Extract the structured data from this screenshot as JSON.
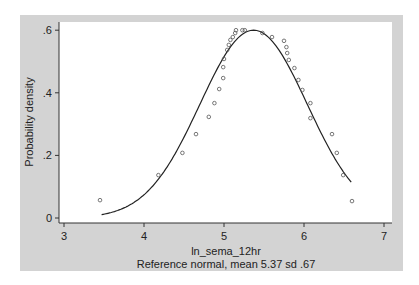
{
  "chart_data": {
    "type": "scatter",
    "title": "",
    "xlabel": "ln_sema_12hr",
    "ylabel": "Probability density",
    "note": "Reference normal, mean 5.37 sd .67",
    "xlim": [
      3,
      7
    ],
    "ylim": [
      0,
      0.6
    ],
    "x_ticks": [
      3,
      4,
      5,
      6,
      7
    ],
    "x_tick_labels": [
      "3",
      "4",
      "5",
      "6",
      "7"
    ],
    "y_ticks": [
      0,
      0.2,
      0.4,
      0.6
    ],
    "y_tick_labels": [
      "0",
      ".2",
      ".4",
      ".6"
    ],
    "grid": false,
    "legend": null,
    "series": [
      {
        "name": "Observed density",
        "style": "hollow-circle",
        "x": [
          3.45,
          4.18,
          4.48,
          4.65,
          4.81,
          4.88,
          4.94,
          4.99,
          4.99,
          5.0,
          5.04,
          5.06,
          5.08,
          5.11,
          5.14,
          5.15,
          5.23,
          5.26,
          5.48,
          5.6,
          5.75,
          5.78,
          5.79,
          5.81,
          5.88,
          5.93,
          5.98,
          6.08,
          6.08,
          6.35,
          6.41,
          6.49,
          6.6
        ],
        "y": [
          0.057,
          0.137,
          0.208,
          0.268,
          0.323,
          0.367,
          0.412,
          0.447,
          0.482,
          0.508,
          0.537,
          0.553,
          0.569,
          0.578,
          0.591,
          0.6,
          0.6,
          0.6,
          0.591,
          0.578,
          0.566,
          0.546,
          0.527,
          0.505,
          0.479,
          0.441,
          0.409,
          0.367,
          0.319,
          0.268,
          0.208,
          0.137,
          0.054
        ]
      },
      {
        "name": "Reference normal",
        "style": "line",
        "mean": 5.37,
        "sd": 0.67,
        "x_range": [
          3.47,
          6.6
        ]
      }
    ]
  },
  "colors": {
    "outer_background": "#d3d3d3",
    "plot_background": "#ffffff",
    "marker": "#555555",
    "line": "#222222"
  }
}
